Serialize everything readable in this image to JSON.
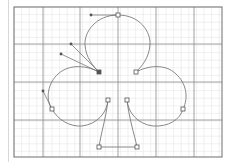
{
  "canvas": {
    "name": "path-editing-artboard",
    "frame": {
      "x": 14,
      "y": 7,
      "width": 208,
      "height": 150
    },
    "colors": {
      "background": "#ffffff",
      "minor_grid": "#e6e6e6",
      "major_grid": "#8c8c8c",
      "frame": "#6e6e6e",
      "path": "#7a7a7a",
      "anchor_fill": "#ffffff",
      "anchor_stroke": "#555555",
      "handle_line": "#666666",
      "handle_point": "#555555"
    },
    "grid": {
      "minor_spacing": 7.6,
      "major_x": [
        43,
        80,
        118,
        156,
        194
      ],
      "major_y": [
        44,
        82,
        120
      ]
    },
    "shape": "club-suit",
    "anchors": [
      {
        "id": "top",
        "x": 118,
        "y": 15,
        "selected": false
      },
      {
        "id": "left-notch",
        "x": 99,
        "y": 72,
        "selected": true
      },
      {
        "id": "right-notch",
        "x": 136,
        "y": 72,
        "selected": false
      },
      {
        "id": "left-lobe-side",
        "x": 52,
        "y": 109,
        "selected": false
      },
      {
        "id": "right-lobe-side",
        "x": 183,
        "y": 109,
        "selected": false
      },
      {
        "id": "stem-left-top",
        "x": 108,
        "y": 100,
        "selected": false
      },
      {
        "id": "stem-right-top",
        "x": 127,
        "y": 100,
        "selected": false
      },
      {
        "id": "stem-left-bottom",
        "x": 99,
        "y": 147,
        "selected": false
      },
      {
        "id": "stem-right-bottom",
        "x": 137,
        "y": 147,
        "selected": false
      }
    ],
    "handles": [
      {
        "from": "top",
        "x": 91,
        "y": 15
      },
      {
        "from": "left-notch",
        "x": 71,
        "y": 44
      },
      {
        "from": "left-notch",
        "x": 61,
        "y": 54
      },
      {
        "from": "left-lobe-side",
        "x": 43,
        "y": 91
      }
    ]
  }
}
